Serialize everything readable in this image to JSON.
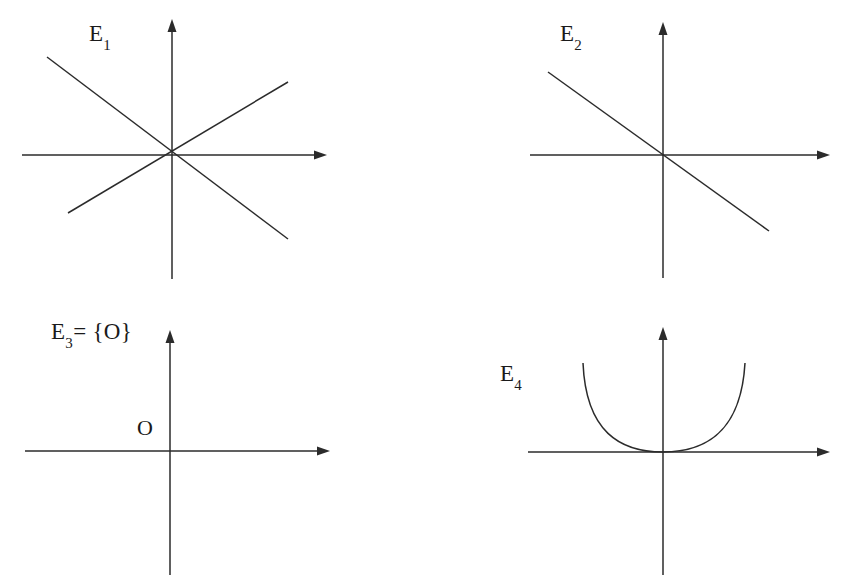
{
  "figure": {
    "background_color": "#ffffff",
    "ink_color": "#2b2b2b",
    "width": 846,
    "height": 585
  },
  "panels": [
    {
      "id": "E1",
      "label_base": "E",
      "label_subscript": "1",
      "label_suffix": "",
      "description": "Pair of crossing straight lines through the origin (union of two lines)",
      "curve_type": "two-lines",
      "origin": {
        "x": 172,
        "y": 155
      },
      "x_axis": {
        "start_x": 22,
        "end_x": 327,
        "y": 155,
        "arrow": "right"
      },
      "y_axis": {
        "x": 172,
        "start_y": 279,
        "end_y": 19,
        "arrow": "up"
      },
      "lines": [
        {
          "name": "descending-line",
          "x1": 47,
          "y1": 57,
          "x2": 288,
          "y2": 239
        },
        {
          "name": "ascending-line",
          "x1": 68,
          "y1": 213,
          "x2": 288,
          "y2": 82
        }
      ],
      "label_position": {
        "x": 89,
        "y": 22
      }
    },
    {
      "id": "E2",
      "label_base": "E",
      "label_subscript": "2",
      "label_suffix": "",
      "description": "Single straight line of negative slope through the origin",
      "curve_type": "single-line",
      "origin": {
        "x": 663,
        "y": 155
      },
      "x_axis": {
        "start_x": 530,
        "end_x": 830,
        "y": 155,
        "arrow": "right"
      },
      "y_axis": {
        "x": 663,
        "start_y": 278,
        "end_y": 22,
        "arrow": "up"
      },
      "lines": [
        {
          "name": "negative-slope-line",
          "x1": 548,
          "y1": 72,
          "x2": 769,
          "y2": 231
        }
      ],
      "label_position": {
        "x": 560,
        "y": 22
      }
    },
    {
      "id": "E3",
      "label_base": "E",
      "label_subscript": "3",
      "label_suffix": "= {O}",
      "description": "Set containing only the origin point O; axes drawn with no curve",
      "curve_type": "point-only",
      "origin": {
        "x": 170,
        "y": 451
      },
      "x_axis": {
        "start_x": 25,
        "end_x": 330,
        "y": 451,
        "arrow": "right"
      },
      "y_axis": {
        "x": 170,
        "start_y": 575,
        "end_y": 330,
        "arrow": "up"
      },
      "lines": [],
      "label_position": {
        "x": 51,
        "y": 320
      },
      "origin_point_label": "O",
      "origin_label_position": {
        "x": 137,
        "y": 417
      }
    },
    {
      "id": "E4",
      "label_base": "E",
      "label_subscript": "4",
      "label_suffix": "",
      "description": "Upward-opening parabola with vertex at the origin",
      "curve_type": "parabola",
      "origin": {
        "x": 663,
        "y": 452
      },
      "x_axis": {
        "start_x": 528,
        "end_x": 830,
        "y": 452,
        "arrow": "right"
      },
      "y_axis": {
        "x": 663,
        "start_y": 575,
        "end_y": 327,
        "arrow": "up"
      },
      "lines": [],
      "parabola": {
        "vertex_x": 663,
        "vertex_y": 452,
        "left_end_x": 583,
        "left_end_y": 363,
        "right_end_x": 745,
        "right_end_y": 363
      },
      "label_position": {
        "x": 500,
        "y": 362
      }
    }
  ]
}
